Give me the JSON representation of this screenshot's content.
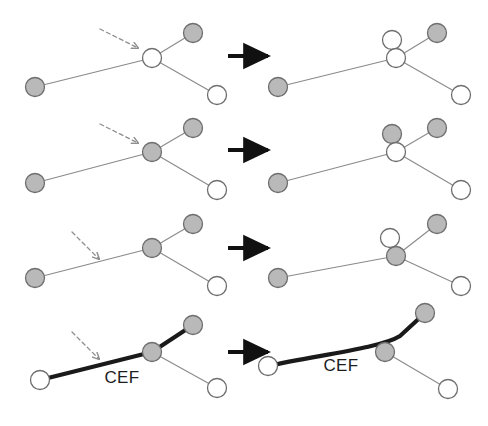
{
  "figure": {
    "background_color": "#ffffff",
    "colors": {
      "node_filled": "#b9b9b9",
      "node_empty": "#ffffff",
      "node_stroke": "#6e6e6e",
      "edge": "#8a8a8a",
      "highlight_edge": "#1a1a1a",
      "arrow": "#111111",
      "dashed_arrow": "#8e8e8e",
      "label_text": "#1d1d1d"
    },
    "labels": {
      "cef_left": "CEF",
      "cef_right": "CEF"
    },
    "geometry": {
      "node_radius": 9.5,
      "canvas_width": 488,
      "canvas_height": 426
    },
    "rows": [
      {
        "id": "row-1",
        "name": "split-empty-center-node",
        "before": {
          "nodes": [
            {
              "id": "left",
              "cx": 35,
              "cy": 87,
              "fill": "filled"
            },
            {
              "id": "center",
              "cx": 152,
              "cy": 58,
              "fill": "empty"
            },
            {
              "id": "upper-right",
              "cx": 193,
              "cy": 33,
              "fill": "filled"
            },
            {
              "id": "lower-right",
              "cx": 217,
              "cy": 95,
              "fill": "empty"
            }
          ],
          "edges": [
            {
              "from": "left",
              "to": "center",
              "style": "thin"
            },
            {
              "from": "center",
              "to": "upper-right",
              "style": "thin"
            },
            {
              "from": "center",
              "to": "lower-right",
              "style": "thin"
            }
          ],
          "dashed_arrow": {
            "x1": 100,
            "y1": 29,
            "x2": 141,
            "y2": 50
          }
        },
        "after": {
          "nodes": [
            {
              "id": "left",
              "cx": 278,
              "cy": 87,
              "fill": "filled"
            },
            {
              "id": "center",
              "cx": 396,
              "cy": 58,
              "fill": "empty"
            },
            {
              "id": "split",
              "cx": 392,
              "cy": 40,
              "fill": "empty"
            },
            {
              "id": "upper-right",
              "cx": 437,
              "cy": 33,
              "fill": "filled"
            },
            {
              "id": "lower-right",
              "cx": 461,
              "cy": 95,
              "fill": "empty"
            }
          ],
          "edges": [
            {
              "from": "left",
              "to": "center",
              "style": "thin"
            },
            {
              "from": "center",
              "to": "upper-right",
              "style": "thin"
            },
            {
              "from": "center",
              "to": "lower-right",
              "style": "thin"
            }
          ]
        },
        "arrow": {
          "x1": 228,
          "y1": 56,
          "x2": 272,
          "y2": 56
        }
      },
      {
        "id": "row-2",
        "name": "split-filled-center-node-upward",
        "before": {
          "nodes": [
            {
              "id": "left",
              "cx": 35,
              "cy": 183,
              "fill": "filled"
            },
            {
              "id": "center",
              "cx": 152,
              "cy": 152,
              "fill": "filled"
            },
            {
              "id": "upper-right",
              "cx": 193,
              "cy": 128,
              "fill": "filled"
            },
            {
              "id": "lower-right",
              "cx": 217,
              "cy": 190,
              "fill": "empty"
            }
          ],
          "edges": [
            {
              "from": "left",
              "to": "center",
              "style": "thin"
            },
            {
              "from": "center",
              "to": "upper-right",
              "style": "thin"
            },
            {
              "from": "center",
              "to": "lower-right",
              "style": "thin"
            }
          ],
          "dashed_arrow": {
            "x1": 100,
            "y1": 124,
            "x2": 141,
            "y2": 145
          }
        },
        "after": {
          "nodes": [
            {
              "id": "left",
              "cx": 278,
              "cy": 183,
              "fill": "filled"
            },
            {
              "id": "center",
              "cx": 396,
              "cy": 152,
              "fill": "empty"
            },
            {
              "id": "split",
              "cx": 392,
              "cy": 134,
              "fill": "filled"
            },
            {
              "id": "upper-right",
              "cx": 437,
              "cy": 128,
              "fill": "filled"
            },
            {
              "id": "lower-right",
              "cx": 461,
              "cy": 190,
              "fill": "empty"
            }
          ],
          "edges": [
            {
              "from": "left",
              "to": "center",
              "style": "thin"
            },
            {
              "from": "center",
              "to": "upper-right",
              "style": "thin"
            },
            {
              "from": "center",
              "to": "lower-right",
              "style": "thin"
            }
          ]
        },
        "arrow": {
          "x1": 228,
          "y1": 150,
          "x2": 272,
          "y2": 150
        }
      },
      {
        "id": "row-3",
        "name": "split-edge-pointed-node-downward",
        "before": {
          "nodes": [
            {
              "id": "left",
              "cx": 35,
              "cy": 278,
              "fill": "filled"
            },
            {
              "id": "center",
              "cx": 152,
              "cy": 248,
              "fill": "filled"
            },
            {
              "id": "upper-right",
              "cx": 193,
              "cy": 224,
              "fill": "filled"
            },
            {
              "id": "lower-right",
              "cx": 217,
              "cy": 286,
              "fill": "empty"
            }
          ],
          "edges": [
            {
              "from": "left",
              "to": "center",
              "style": "thin"
            },
            {
              "from": "center",
              "to": "upper-right",
              "style": "thin"
            },
            {
              "from": "center",
              "to": "lower-right",
              "style": "thin"
            }
          ],
          "dashed_arrow": {
            "x1": 72,
            "y1": 232,
            "x2": 102,
            "y2": 262
          }
        },
        "after": {
          "nodes": [
            {
              "id": "left",
              "cx": 278,
              "cy": 278,
              "fill": "filled"
            },
            {
              "id": "center",
              "cx": 396,
              "cy": 256,
              "fill": "filled"
            },
            {
              "id": "split",
              "cx": 390,
              "cy": 238,
              "fill": "empty"
            },
            {
              "id": "upper-right",
              "cx": 437,
              "cy": 224,
              "fill": "filled"
            },
            {
              "id": "lower-right",
              "cx": 461,
              "cy": 286,
              "fill": "empty"
            }
          ],
          "edges": [
            {
              "from": "left",
              "to": "center",
              "style": "thin"
            },
            {
              "from": "center",
              "to": "upper-right",
              "style": "thin"
            },
            {
              "from": "center",
              "to": "lower-right",
              "style": "thin"
            }
          ]
        },
        "arrow": {
          "x1": 228,
          "y1": 248,
          "x2": 272,
          "y2": 248
        }
      },
      {
        "id": "row-4",
        "name": "cef-path-bypasses-center-node",
        "before": {
          "nodes": [
            {
              "id": "left",
              "cx": 40,
              "cy": 380,
              "fill": "empty"
            },
            {
              "id": "center",
              "cx": 152,
              "cy": 352,
              "fill": "filled"
            },
            {
              "id": "upper-right",
              "cx": 193,
              "cy": 325,
              "fill": "filled"
            },
            {
              "id": "lower-right",
              "cx": 217,
              "cy": 388,
              "fill": "empty"
            }
          ],
          "edges": [
            {
              "from": "left",
              "to": "center",
              "style": "thick"
            },
            {
              "from": "center",
              "to": "upper-right",
              "style": "thick"
            },
            {
              "from": "center",
              "to": "lower-right",
              "style": "thin"
            }
          ],
          "dashed_arrow": {
            "x1": 72,
            "y1": 332,
            "x2": 102,
            "y2": 362
          },
          "label": {
            "text": "CEF",
            "x": 122,
            "y": 383
          }
        },
        "after": {
          "nodes": [
            {
              "id": "left",
              "cx": 268,
              "cy": 366,
              "fill": "empty"
            },
            {
              "id": "center",
              "cx": 385,
              "cy": 352,
              "fill": "filled"
            },
            {
              "id": "upper-right",
              "cx": 425,
              "cy": 313,
              "fill": "filled"
            },
            {
              "id": "lower-right",
              "cx": 448,
              "cy": 389,
              "fill": "empty"
            }
          ],
          "edges": [
            {
              "from": "left",
              "to": "upper-right",
              "style": "thick-curved"
            },
            {
              "from": "center",
              "to": "lower-right",
              "style": "thin"
            }
          ],
          "label": {
            "text": "CEF",
            "x": 341,
            "y": 371
          }
        },
        "arrow": {
          "x1": 228,
          "y1": 352,
          "x2": 272,
          "y2": 352
        }
      }
    ]
  }
}
